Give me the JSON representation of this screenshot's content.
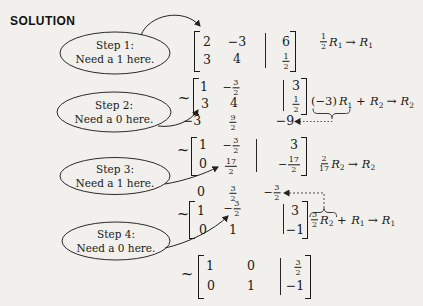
{
  "page": {
    "title": "SOLUTION",
    "tilde": "~"
  },
  "colors": {
    "ink": "#1a1a1a",
    "paper": "#f1f0ec"
  },
  "steps": [
    {
      "label": "Step 1:",
      "caption": "Need a 1 here."
    },
    {
      "label": "Step 2:",
      "caption": "Need a 0 here."
    },
    {
      "label": "Step 3:",
      "caption": "Need a 1 here."
    },
    {
      "label": "Step 4:",
      "caption": "Need a 0 here."
    }
  ],
  "matrices": {
    "m1": {
      "r1c1": "2",
      "r1c2": "−3",
      "r1aug": "6",
      "r2c1": "3",
      "r2c2": "4",
      "r2aug_num": "1",
      "r2aug_den": "2"
    },
    "m2": {
      "r1c1": "1",
      "r1c2_sign": "−",
      "r1c2_num": "3",
      "r1c2_den": "2",
      "r1aug": "3",
      "r2c1": "3",
      "r2c2": "4",
      "r2aug_num": "1",
      "r2aug_den": "2"
    },
    "auxA": {
      "c1": "−3",
      "c2_num": "9",
      "c2_den": "2",
      "c3": "−9"
    },
    "m3": {
      "r1c1": "1",
      "r1c2_sign": "−",
      "r1c2_num": "3",
      "r1c2_den": "2",
      "r1aug": "3",
      "r2c1": "0",
      "r2c2_num": "17",
      "r2c2_den": "2",
      "r2aug_sign": "−",
      "r2aug_num": "17",
      "r2aug_den": "2"
    },
    "auxB": {
      "c1": "0",
      "c2_num": "3",
      "c2_den": "2",
      "c3_sign": "−",
      "c3_num": "3",
      "c3_den": "2"
    },
    "m4": {
      "r1c1": "1",
      "r1c2_sign": "−",
      "r1c2_num": "3",
      "r1c2_den": "2",
      "r1aug": "3",
      "r2c1": "0",
      "r2c2": "1",
      "r2aug": "−1"
    },
    "m5": {
      "r1c1": "1",
      "r1c2": "0",
      "r1aug_num": "3",
      "r1aug_den": "2",
      "r2c1": "0",
      "r2c2": "1",
      "r2aug": "−1"
    }
  },
  "ops": {
    "op1": {
      "coef_num": "1",
      "coef_den": "2",
      "rA": "R",
      "rA_sub": "1",
      "arrow": "→",
      "rB": "R",
      "rB_sub": "1"
    },
    "op2": {
      "coef": "(−3)",
      "rA": "R",
      "rA_sub": "1",
      "plus": "+",
      "rB": "R",
      "rB_sub": "2",
      "arrow": "→",
      "rC": "R",
      "rC_sub": "2"
    },
    "op3": {
      "coef_num": "2",
      "coef_den": "17",
      "rA": "R",
      "rA_sub": "2",
      "arrow": "→",
      "rB": "R",
      "rB_sub": "2"
    },
    "op4": {
      "coef_num": "3",
      "coef_den": "2",
      "rA": "R",
      "rA_sub": "2",
      "plus": "+",
      "rB": "R",
      "rB_sub": "1",
      "arrow": "→",
      "rC": "R",
      "rC_sub": "1"
    }
  }
}
